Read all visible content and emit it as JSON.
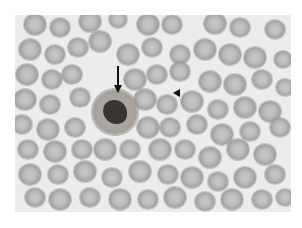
{
  "figure": {
    "frame": {
      "x": 15,
      "y": 15,
      "w": 276,
      "h": 197,
      "background": "#ececec"
    },
    "annotations": [
      {
        "type": "arrow",
        "label": "arrow pointing to neutrophil",
        "x": 118,
        "y1": 66,
        "y2": 93,
        "color": "#111111"
      },
      {
        "type": "arrowhead",
        "label": "arrowhead marker",
        "x": 173,
        "y": 93,
        "color": "#111111"
      }
    ],
    "leukocyte": {
      "cx": 115,
      "cy": 112,
      "r": 22
    },
    "rbcs": [
      [
        35,
        25,
        11
      ],
      [
        60,
        28,
        10
      ],
      [
        90,
        22,
        11
      ],
      [
        118,
        20,
        9
      ],
      [
        148,
        25,
        11
      ],
      [
        172,
        25,
        10
      ],
      [
        215,
        24,
        11
      ],
      [
        240,
        28,
        10
      ],
      [
        275,
        30,
        10
      ],
      [
        30,
        50,
        11
      ],
      [
        55,
        55,
        10
      ],
      [
        78,
        48,
        10
      ],
      [
        100,
        42,
        11
      ],
      [
        128,
        55,
        11
      ],
      [
        152,
        48,
        10
      ],
      [
        180,
        55,
        10
      ],
      [
        205,
        50,
        11
      ],
      [
        230,
        55,
        11
      ],
      [
        255,
        58,
        11
      ],
      [
        283,
        60,
        9
      ],
      [
        27,
        75,
        11
      ],
      [
        52,
        80,
        10
      ],
      [
        72,
        75,
        10
      ],
      [
        135,
        80,
        11
      ],
      [
        157,
        75,
        10
      ],
      [
        180,
        72,
        10
      ],
      [
        210,
        82,
        11
      ],
      [
        235,
        85,
        11
      ],
      [
        262,
        80,
        10
      ],
      [
        285,
        88,
        9
      ],
      [
        25,
        100,
        11
      ],
      [
        50,
        105,
        10
      ],
      [
        80,
        98,
        10
      ],
      [
        145,
        100,
        11
      ],
      [
        167,
        105,
        10
      ],
      [
        192,
        102,
        11
      ],
      [
        218,
        110,
        10
      ],
      [
        245,
        108,
        11
      ],
      [
        270,
        112,
        11
      ],
      [
        22,
        125,
        10
      ],
      [
        48,
        130,
        11
      ],
      [
        75,
        128,
        10
      ],
      [
        148,
        128,
        11
      ],
      [
        170,
        128,
        10
      ],
      [
        197,
        125,
        10
      ],
      [
        222,
        135,
        11
      ],
      [
        250,
        132,
        10
      ],
      [
        280,
        128,
        10
      ],
      [
        28,
        150,
        10
      ],
      [
        55,
        152,
        11
      ],
      [
        82,
        150,
        10
      ],
      [
        105,
        150,
        11
      ],
      [
        130,
        150,
        10
      ],
      [
        160,
        150,
        11
      ],
      [
        185,
        150,
        10
      ],
      [
        210,
        158,
        11
      ],
      [
        238,
        150,
        11
      ],
      [
        265,
        155,
        11
      ],
      [
        30,
        175,
        11
      ],
      [
        58,
        175,
        10
      ],
      [
        85,
        172,
        11
      ],
      [
        112,
        178,
        10
      ],
      [
        140,
        172,
        11
      ],
      [
        168,
        175,
        10
      ],
      [
        192,
        178,
        11
      ],
      [
        218,
        182,
        10
      ],
      [
        245,
        178,
        11
      ],
      [
        275,
        175,
        10
      ],
      [
        35,
        198,
        10
      ],
      [
        60,
        200,
        11
      ],
      [
        90,
        198,
        10
      ],
      [
        120,
        200,
        11
      ],
      [
        148,
        200,
        10
      ],
      [
        175,
        198,
        11
      ],
      [
        205,
        202,
        10
      ],
      [
        232,
        200,
        11
      ],
      [
        262,
        200,
        10
      ],
      [
        285,
        198,
        9
      ]
    ]
  }
}
